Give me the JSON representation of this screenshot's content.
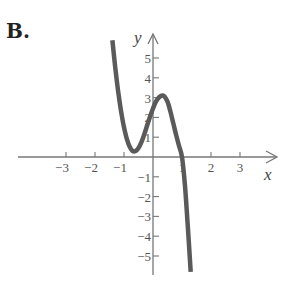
{
  "figure": {
    "label": "B.",
    "x_axis_label": "x",
    "y_axis_label": "y",
    "colors": {
      "curve": "#5a5a5a",
      "axes": "#777777",
      "text": "#555555"
    }
  },
  "chart_data": {
    "type": "line",
    "title": "B.",
    "xlabel": "x",
    "ylabel": "y",
    "xlim": [
      -3.5,
      4
    ],
    "ylim": [
      -6,
      6
    ],
    "grid": false,
    "legend": null,
    "x_ticks": [
      -3,
      -2,
      -1,
      1,
      2,
      3
    ],
    "x_tick_labels": [
      "−3",
      "−2",
      "−1",
      "1",
      "2",
      "3"
    ],
    "y_ticks": [
      5,
      4,
      3,
      2,
      1,
      -1,
      -2,
      -3,
      -4,
      -5
    ],
    "y_tick_labels": [
      "5",
      "4",
      "3",
      "2",
      "1",
      "−1",
      "−2",
      "−3",
      "−4",
      "−5"
    ],
    "annotations": [
      "local minimum near (-0.6, 0.3)",
      "local maximum near (0.35, 3.1)",
      "x-intercept at x = 1"
    ],
    "series": [
      {
        "name": "cubic curve",
        "x": [
          -1.4,
          -1.3,
          -1.2,
          -1.1,
          -1.0,
          -0.9,
          -0.8,
          -0.7,
          -0.6,
          -0.5,
          -0.4,
          -0.3,
          -0.2,
          -0.1,
          0.0,
          0.1,
          0.2,
          0.3,
          0.35,
          0.4,
          0.5,
          0.6,
          0.7,
          0.8,
          0.9,
          1.0,
          1.1,
          1.2,
          1.3
        ],
        "y": [
          5.9,
          4.5,
          3.3,
          2.3,
          1.5,
          0.9,
          0.5,
          0.3,
          0.3,
          0.45,
          0.75,
          1.15,
          1.6,
          2.05,
          2.45,
          2.8,
          3.0,
          3.1,
          3.1,
          3.05,
          2.8,
          2.3,
          1.7,
          1.1,
          0.55,
          0.0,
          -1.4,
          -3.5,
          -5.8
        ]
      }
    ]
  }
}
